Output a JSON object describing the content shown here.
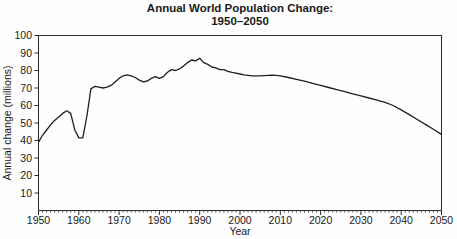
{
  "chart_data": {
    "type": "line",
    "title": "Annual World Population Change: 1950–2050",
    "title_lines": [
      "Annual World Population Change:",
      "1950–2050"
    ],
    "xlabel": "Year",
    "ylabel": "Annual change (millions)",
    "xlim": [
      1950,
      2050
    ],
    "ylim": [
      0,
      100
    ],
    "x_ticks": [
      1950,
      1960,
      1970,
      1980,
      1990,
      2000,
      2010,
      2020,
      2030,
      2040,
      2050
    ],
    "x_minor_tick_every": 1,
    "y_ticks": [
      10,
      20,
      30,
      40,
      50,
      60,
      70,
      80,
      90,
      100
    ],
    "grid": false,
    "legend": "none",
    "line_color": "#1f1f1f",
    "background": "#ffffff",
    "series": [
      {
        "name": "Annual world population change (millions)",
        "x": [
          1950,
          1951,
          1952,
          1953,
          1954,
          1955,
          1956,
          1957,
          1958,
          1959,
          1960,
          1961,
          1962,
          1963,
          1964,
          1965,
          1966,
          1967,
          1968,
          1969,
          1970,
          1971,
          1972,
          1973,
          1974,
          1975,
          1976,
          1977,
          1978,
          1979,
          1980,
          1981,
          1982,
          1983,
          1984,
          1985,
          1986,
          1987,
          1988,
          1989,
          1990,
          1991,
          1992,
          1993,
          1994,
          1995,
          1996,
          1997,
          1998,
          1999,
          2000,
          2001,
          2002,
          2003,
          2004,
          2005,
          2006,
          2007,
          2008,
          2009,
          2010,
          2012,
          2014,
          2016,
          2018,
          2020,
          2022,
          2024,
          2026,
          2028,
          2030,
          2032,
          2034,
          2036,
          2038,
          2040,
          2042,
          2044,
          2046,
          2048,
          2050
        ],
        "values": [
          39,
          43,
          46,
          49,
          51.5,
          53.5,
          55.5,
          57,
          55.5,
          46,
          41.5,
          41.5,
          54,
          69.5,
          71,
          70.5,
          70,
          70.5,
          71.5,
          73.5,
          75.5,
          77,
          77.5,
          77,
          76,
          74.5,
          73.5,
          74,
          75.5,
          76.5,
          75.5,
          76.5,
          79,
          80.5,
          80,
          81,
          82.5,
          84.5,
          86,
          85.5,
          87,
          84.5,
          83.5,
          82,
          81.5,
          80.5,
          80.5,
          79.5,
          79,
          78.5,
          78,
          77.5,
          77.2,
          77,
          77,
          77,
          77.1,
          77.2,
          77.3,
          77.2,
          77,
          76,
          75,
          73.9,
          72.7,
          71.5,
          70.3,
          69.1,
          67.9,
          66.7,
          65.5,
          64.3,
          63.1,
          61.8,
          60,
          57.5,
          54.8,
          52,
          49.2,
          46.4,
          43.5
        ]
      }
    ]
  }
}
